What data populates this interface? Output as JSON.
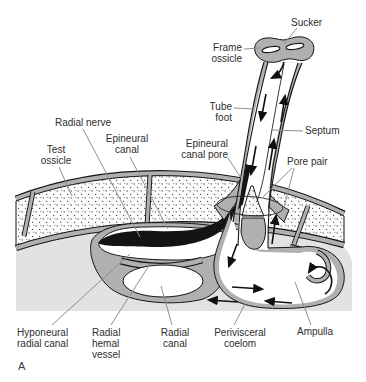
{
  "figure": {
    "panel_letter": "A",
    "labels": {
      "sucker": "Sucker",
      "frame_ossicle": "Frame ossicle",
      "tube_foot": "Tube foot",
      "septum": "Septum",
      "epineural_canal_pore": "Epineural canal pore",
      "pore_pair": "Pore pair",
      "radial_nerve": "Radial nerve",
      "epineural_canal": "Epineural canal",
      "test_ossicle": "Test ossicle",
      "hyponeural_radial_canal": "Hyponeural radial canal",
      "radial_hemal_vessel": "Radial hemal vessel",
      "radial_canal": "Radial canal",
      "perivisceral_coelom": "Perivisceral coelom",
      "ampulla": "Ampulla"
    },
    "colors": {
      "tissue_gray": "#b0b0b0",
      "coelom_gray": "#e2e2e2",
      "nerve_black": "#141414",
      "outline": "#151515",
      "leader_gray": "#8f8f8f",
      "label_text": "#2e2e2e",
      "background": "#ffffff"
    }
  }
}
